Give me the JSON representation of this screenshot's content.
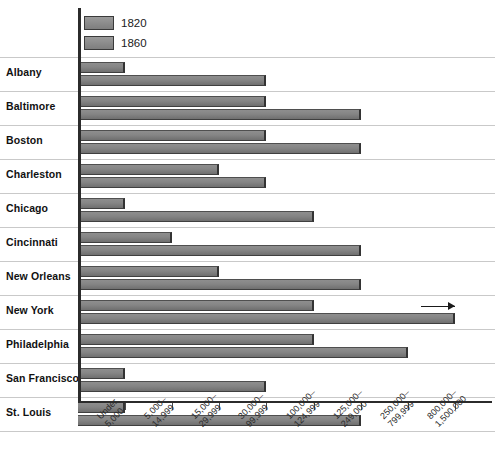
{
  "chart_data": {
    "type": "bar",
    "orientation": "horizontal",
    "title": "",
    "xlabel": "",
    "ylabel": "",
    "grid": true,
    "legend_position": "top-left",
    "categories": [
      "Albany",
      "Baltimore",
      "Boston",
      "Charleston",
      "Chicago",
      "Cincinnati",
      "New Orleans",
      "New York",
      "Philadelphia",
      "San Francisco",
      "St. Louis"
    ],
    "x_tick_labels": [
      {
        "line1": "Under",
        "line2": "5,000"
      },
      {
        "line1": "5,000–",
        "line2": "14,999"
      },
      {
        "line1": "15,000–",
        "line2": "29,999"
      },
      {
        "line1": "30,000–",
        "line2": "99,999"
      },
      {
        "line1": "100,000–",
        "line2": "124,999"
      },
      {
        "line1": "125,000–",
        "line2": "249,000"
      },
      {
        "line1": "250,000–",
        "line2": "799,999"
      },
      {
        "line1": "800,000–",
        "line2": "1,500,000"
      }
    ],
    "x_bins": [
      "Under 5,000",
      "5,000–14,999",
      "15,000–29,999",
      "30,000–99,999",
      "100,000–124,999",
      "125,000–249,000",
      "250,000–799,999",
      "800,000–1,500,000"
    ],
    "series": [
      {
        "name": "1820",
        "color": "#858585",
        "values": [
          1,
          4,
          4,
          3,
          1,
          2,
          3,
          5,
          5,
          1,
          1
        ]
      },
      {
        "name": "1860",
        "color": "#858585",
        "values": [
          4,
          6,
          6,
          4,
          5,
          6,
          6,
          8,
          7,
          4,
          6
        ]
      }
    ],
    "annotations": [
      {
        "category": "New York",
        "series": "1860",
        "type": "arrow-right",
        "note": "bar extends beyond axis"
      }
    ]
  },
  "legend": {
    "items": [
      {
        "label": "1820"
      },
      {
        "label": "1860"
      }
    ]
  },
  "colors": {
    "bar_fill": "#858585",
    "bar_border": "#3f3f3f",
    "axis": "#2b2b2b",
    "gridline": "#c9c9c9",
    "text": "#111111",
    "background": "#ffffff"
  }
}
